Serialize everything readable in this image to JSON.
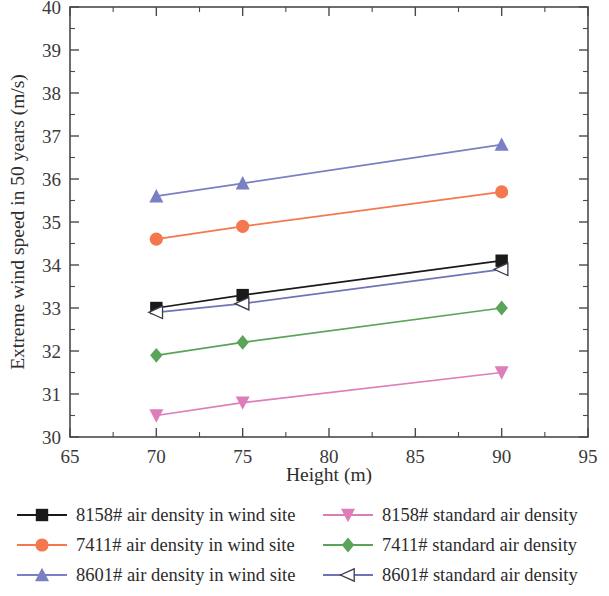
{
  "chart_data": {
    "type": "line",
    "title": "",
    "xlabel": "Height (m)",
    "ylabel": "Extreme wind speed in 50 years (m/s)",
    "xlim": [
      65,
      95
    ],
    "ylim": [
      30,
      40
    ],
    "x_ticks": [
      65,
      70,
      75,
      80,
      85,
      90,
      95
    ],
    "y_ticks": [
      30,
      31,
      32,
      33,
      34,
      35,
      36,
      37,
      38,
      39,
      40
    ],
    "x_minor_step": 2.5,
    "y_minor_step": 0.5,
    "grid": false,
    "legend_position": "below-plot-two-columns",
    "x": [
      70,
      75,
      90
    ],
    "series": [
      {
        "name": "8158# air density in wind site",
        "values": [
          33.0,
          33.3,
          34.1
        ],
        "color": "#1a1a1a",
        "marker": "square-filled"
      },
      {
        "name": "7411# air density in wind site",
        "values": [
          34.6,
          34.9,
          35.7
        ],
        "color": "#f4784e",
        "marker": "circle-filled"
      },
      {
        "name": "8601# air density in wind site",
        "values": [
          35.6,
          35.9,
          36.8
        ],
        "color": "#7b7fc4",
        "marker": "triangle-up-filled"
      },
      {
        "name": "8158# standard air density",
        "values": [
          30.5,
          30.8,
          31.5
        ],
        "color": "#df7dba",
        "marker": "triangle-down-filled"
      },
      {
        "name": "7411# standard air density",
        "values": [
          31.9,
          32.2,
          33.0
        ],
        "color": "#5aa45a",
        "marker": "diamond-filled"
      },
      {
        "name": "8601# standard air density",
        "values": [
          32.9,
          33.1,
          33.9
        ],
        "color": "#6f73b8",
        "marker": "triangle-left-open"
      }
    ]
  },
  "axes": {
    "x_title": "Height (m)",
    "y_title": "Extreme wind speed in 50 years (m/s)",
    "x_tick_labels": [
      "65",
      "70",
      "75",
      "80",
      "85",
      "90",
      "95"
    ],
    "y_tick_labels": [
      "30",
      "31",
      "32",
      "33",
      "34",
      "35",
      "36",
      "37",
      "38",
      "39",
      "40"
    ]
  },
  "legend": {
    "left_column": [
      {
        "label": "8158# air density in wind site",
        "color": "#1a1a1a",
        "marker": "square-filled"
      },
      {
        "label": "7411# air density in wind site",
        "color": "#f4784e",
        "marker": "circle-filled"
      },
      {
        "label": "8601# air density in wind site",
        "color": "#7b7fc4",
        "marker": "triangle-up-filled"
      }
    ],
    "right_column": [
      {
        "label": "8158# standard air density",
        "color": "#df7dba",
        "marker": "triangle-down-filled"
      },
      {
        "label": "7411# standard air density",
        "color": "#5aa45a",
        "marker": "diamond-filled"
      },
      {
        "label": "8601# standard air density",
        "color": "#6f73b8",
        "marker": "triangle-left-open"
      }
    ]
  }
}
